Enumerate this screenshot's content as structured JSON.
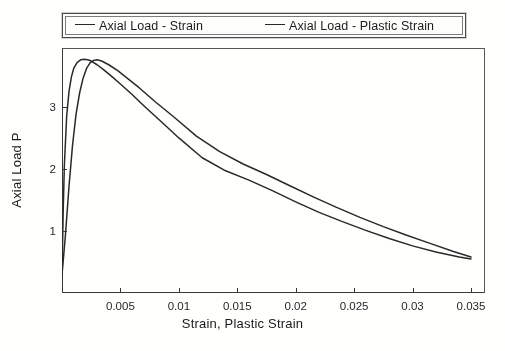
{
  "chart_data": {
    "type": "line",
    "title": "",
    "xlabel": "Strain, Plastic Strain",
    "ylabel": "Axial Load P",
    "xlim": [
      0.0,
      0.0362
    ],
    "ylim": [
      0.0,
      3.95
    ],
    "xticks": [
      0.005,
      0.01,
      0.015,
      0.02,
      0.025,
      0.03,
      0.035
    ],
    "xtick_labels": [
      "0.005",
      "0.01",
      "0.015",
      "0.02",
      "0.025",
      "0.03",
      "0.035"
    ],
    "yticks": [
      1,
      2,
      3
    ],
    "ytick_labels": [
      "1",
      "2",
      "3"
    ],
    "grid": false,
    "legend_position": "above-plot",
    "line_color": "#2b2b2b",
    "series": [
      {
        "name": "Axial Load - Strain",
        "x": [
          0.0,
          0.0001,
          0.0002,
          0.0004,
          0.0006,
          0.0008,
          0.001,
          0.0013,
          0.0016,
          0.0019,
          0.0022,
          0.0025,
          0.003,
          0.0035,
          0.0042,
          0.005,
          0.006,
          0.007,
          0.0085,
          0.01,
          0.012,
          0.014,
          0.016,
          0.018,
          0.02,
          0.022,
          0.024,
          0.026,
          0.028,
          0.03,
          0.032,
          0.034,
          0.035
        ],
        "y": [
          0.29,
          1.3,
          2.05,
          2.85,
          3.25,
          3.48,
          3.62,
          3.72,
          3.76,
          3.77,
          3.76,
          3.74,
          3.68,
          3.61,
          3.5,
          3.37,
          3.2,
          3.02,
          2.76,
          2.5,
          2.18,
          1.97,
          1.82,
          1.65,
          1.47,
          1.3,
          1.15,
          1.01,
          0.88,
          0.76,
          0.66,
          0.58,
          0.55
        ]
      },
      {
        "name": "Axial Load - Plastic Strain",
        "x": [
          0.0,
          0.0003,
          0.0006,
          0.0009,
          0.0012,
          0.0015,
          0.0018,
          0.0021,
          0.0024,
          0.0027,
          0.003,
          0.0034,
          0.004,
          0.0048,
          0.0056,
          0.0066,
          0.008,
          0.0095,
          0.0115,
          0.0135,
          0.0155,
          0.0175,
          0.0195,
          0.0215,
          0.0235,
          0.0255,
          0.0275,
          0.0295,
          0.0315,
          0.0335,
          0.035
        ],
        "y": [
          0.29,
          0.95,
          1.72,
          2.38,
          2.88,
          3.22,
          3.46,
          3.62,
          3.71,
          3.75,
          3.76,
          3.74,
          3.68,
          3.58,
          3.46,
          3.31,
          3.08,
          2.85,
          2.53,
          2.28,
          2.08,
          1.91,
          1.73,
          1.55,
          1.38,
          1.22,
          1.07,
          0.93,
          0.8,
          0.67,
          0.58
        ]
      }
    ]
  },
  "legend": {
    "entries": [
      {
        "label": "Axial Load - Strain"
      },
      {
        "label": "Axial Load - Plastic Strain"
      }
    ]
  }
}
